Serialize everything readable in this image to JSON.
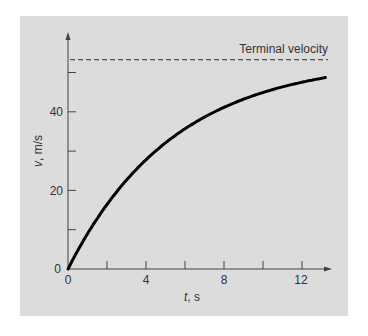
{
  "chart_data": {
    "type": "line",
    "title": "",
    "xlabel_var": "t",
    "xlabel_unit": ", s",
    "ylabel_var": "v",
    "ylabel_unit": ", m/s",
    "xlim": [
      0,
      14
    ],
    "ylim": [
      0,
      58
    ],
    "x_ticks": [
      0,
      2,
      4,
      6,
      8,
      10,
      12
    ],
    "x_tick_labels": [
      "0",
      "4",
      "8",
      "12"
    ],
    "y_ticks": [
      0,
      10,
      20,
      30,
      40,
      50
    ],
    "y_tick_labels": [
      "0",
      "20",
      "40"
    ],
    "grid": false,
    "series": [
      {
        "name": "velocity",
        "style": "solid",
        "color": "#000000",
        "x": [
          0,
          1,
          2,
          3,
          4,
          5,
          6,
          7,
          8,
          9,
          10,
          11,
          12,
          13.2
        ],
        "values": [
          0,
          8.95,
          16.42,
          22.65,
          27.8,
          32.11,
          35.68,
          38.66,
          41.14,
          43.21,
          44.92,
          46.35,
          47.54,
          48.7
        ]
      },
      {
        "name": "Terminal velocity",
        "style": "dashed",
        "color": "#333333",
        "x": [
          0,
          14
        ],
        "values": [
          53.44,
          53.44
        ]
      }
    ],
    "annotations": [
      {
        "text": "Terminal velocity",
        "x": 13.8,
        "y": 53.44
      }
    ]
  },
  "labels": {
    "terminal": "Terminal velocity",
    "x_var": "t",
    "x_unit": ", s",
    "y_var": "v",
    "y_unit": ", m/s",
    "xt0": "0",
    "xt4": "4",
    "xt8": "8",
    "xt12": "12",
    "yt0": "0",
    "yt20": "20",
    "yt40": "40"
  },
  "colors": {
    "panel_bg": "#dcdcdc",
    "axis": "#444444",
    "curve": "#000000"
  }
}
